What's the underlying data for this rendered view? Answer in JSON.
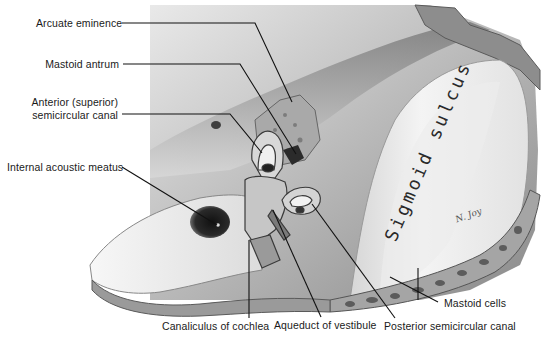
{
  "figure": {
    "type": "anatomical illustration"
  },
  "labels": {
    "arcuate_eminence": "Arcuate eminence",
    "mastoid_antrum": "Mastoid antrum",
    "anterior_canal_line1": "Anterior (superior)",
    "anterior_canal_line2": "semicircular canal",
    "internal_acoustic_meatus": "Internal acoustic meatus",
    "canaliculus_of_cochlea": "Canaliculus of cochlea",
    "aqueduct_of_vestibule": "Aqueduct of vestibule",
    "posterior_semicircular_canal": "Posterior semicircular canal",
    "mastoid_cells": "Mastoid cells"
  },
  "in_image_text": {
    "sigmoid_sulcus": "Sigmoid sulcus",
    "signature": "N. Joy"
  },
  "colors": {
    "background": "#ffffff",
    "label_text": "#1a1a1a",
    "leader_line": "#111111",
    "bone_light": "#f2f2f2",
    "bone_mid": "#bdbdbd",
    "bone_dark": "#6e6e6e",
    "cavity": "#1e1e1e"
  }
}
